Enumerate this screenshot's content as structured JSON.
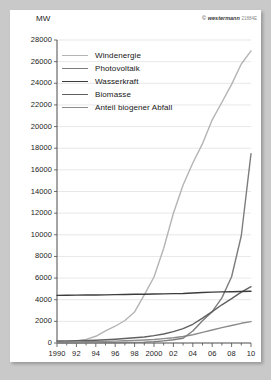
{
  "credit": {
    "symbol": "©",
    "brand": "westermann",
    "code": "21884E"
  },
  "chart_data": {
    "type": "line",
    "title": "",
    "xlabel": "",
    "ylabel": "MW",
    "ylim": [
      0,
      28000
    ],
    "xlim": [
      1990,
      2010
    ],
    "ytick_step": 2000,
    "grid": "horizontal",
    "legend_position": "top-left",
    "yticks": [
      "28000",
      "26000",
      "24000",
      "22000",
      "20000",
      "18000",
      "16000",
      "14000",
      "12000",
      "10000",
      "8000",
      "6000",
      "4000",
      "2000",
      "0"
    ],
    "xticks": [
      "1990",
      "92",
      "94",
      "96",
      "98",
      "2000",
      "02",
      "04",
      "06",
      "08",
      "10"
    ],
    "x": [
      1990,
      1991,
      1992,
      1993,
      1994,
      1995,
      1996,
      1997,
      1998,
      1999,
      2000,
      2001,
      2002,
      2003,
      2004,
      2005,
      2006,
      2007,
      2008,
      2009,
      2010
    ],
    "series": [
      {
        "name": "Windenergie",
        "color": "#b4b4b4",
        "values": [
          60,
          100,
          180,
          330,
          620,
          1120,
          1550,
          2080,
          2870,
          4440,
          6100,
          8750,
          11990,
          14600,
          16630,
          18420,
          20620,
          22250,
          23900,
          25780,
          27000
        ]
      },
      {
        "name": "Photovoltaik",
        "color": "#7d7d7d",
        "values": [
          2,
          3,
          6,
          9,
          12,
          18,
          28,
          42,
          54,
          70,
          114,
          195,
          296,
          435,
          1105,
          2056,
          2899,
          4170,
          6120,
          9914,
          17500
        ]
      },
      {
        "name": "Wasserkraft",
        "color": "#3c3c3c",
        "values": [
          4403,
          4410,
          4420,
          4430,
          4440,
          4450,
          4470,
          4480,
          4500,
          4510,
          4530,
          4540,
          4560,
          4580,
          4620,
          4660,
          4700,
          4720,
          4740,
          4760,
          4780
        ]
      },
      {
        "name": "Biomasse",
        "color": "#606060",
        "values": [
          190,
          200,
          215,
          235,
          260,
          300,
          350,
          410,
          480,
          560,
          680,
          830,
          1050,
          1330,
          1730,
          2300,
          2900,
          3530,
          4100,
          4700,
          5200
        ]
      },
      {
        "name": "Anteil biogener Abfall",
        "color": "#8c8c8c",
        "values": [
          90,
          95,
          105,
          115,
          130,
          150,
          175,
          205,
          240,
          280,
          330,
          400,
          490,
          600,
          760,
          980,
          1200,
          1420,
          1620,
          1820,
          1980
        ]
      }
    ]
  }
}
